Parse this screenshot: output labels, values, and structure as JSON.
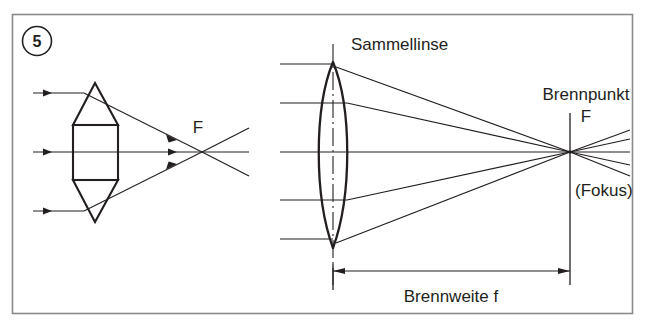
{
  "figure": {
    "number_badge": "5",
    "frame_color": "#8a8a8a",
    "ink_color": "#231f20",
    "background": "#ffffff"
  },
  "labels": {
    "focal_point_left": "F",
    "lens_name": "Sammellinse",
    "focal_point_title": "Brennpunkt",
    "focal_point_symbol": "F",
    "focal_point_alt": "(Fokus)",
    "focal_length": "Brennweite f"
  },
  "left_diagram": {
    "caption": "prism-stack model of a converging lens",
    "ray_count": 3,
    "ray_entry_heights": [
      93,
      152,
      211
    ],
    "focus_x": 202,
    "focus_y": 152,
    "prism": {
      "top_apex": [
        95,
        83
      ],
      "body_left": 73,
      "body_right": 118,
      "body_top": 125,
      "body_bottom": 180,
      "bottom_apex": [
        95,
        222
      ]
    }
  },
  "right_diagram": {
    "caption": "biconvex converging lens focusing five parallel rays",
    "ray_count": 5,
    "ray_entry_heights": [
      64,
      103,
      152,
      200,
      239
    ],
    "lens_center_x": 333,
    "lens_top_y": 62,
    "lens_bottom_y": 248,
    "lens_half_width": 14,
    "focus_x": 570,
    "focus_y": 152,
    "dimension_line_y": 271,
    "dimension_from_x": 333,
    "dimension_to_x": 570
  }
}
